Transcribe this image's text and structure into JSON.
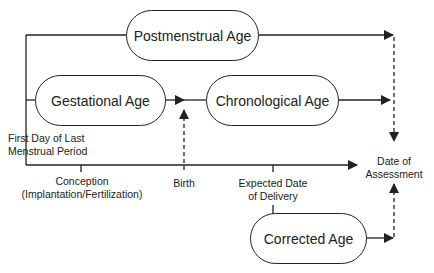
{
  "diagram": {
    "title": "",
    "boxes": {
      "postmenstrual": "Postmenstrual Age",
      "gestational": "Gestational Age",
      "chronological": "Chronological Age",
      "corrected": "Corrected Age"
    },
    "labels": {
      "lmp_line1": "First Day of Last",
      "lmp_line2": "Menstrual Period",
      "conception_line1": "Conception",
      "conception_line2": "(Implantation/Fertilization)",
      "birth": "Birth",
      "edd_line1": "Expected Date",
      "edd_line2": "of Delivery",
      "assessment_line1": "Date of",
      "assessment_line2": "Assessment"
    },
    "colors": {
      "line": "#222222",
      "background": "#ffffff"
    }
  }
}
